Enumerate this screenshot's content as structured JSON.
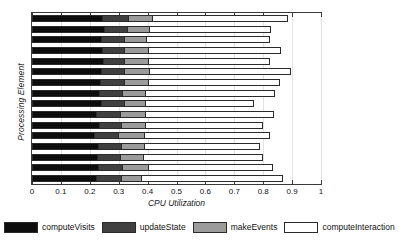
{
  "chart_data": {
    "type": "bar",
    "orientation": "horizontal",
    "stacked": true,
    "title": "",
    "xlabel": "CPU Utilization",
    "ylabel": "Processing Element",
    "xlim": [
      0,
      1
    ],
    "ylim_categories": 16,
    "grid": true,
    "legend_position": "bottom",
    "xticks": [
      "0",
      "0.1",
      "0.2",
      "0.3",
      "0.4",
      "0.5",
      "0.6",
      "0.7",
      "0.8",
      "0.9",
      "1"
    ],
    "xtick_values": [
      0,
      0.1,
      0.2,
      0.3,
      0.4,
      0.5,
      0.6,
      0.7,
      0.8,
      0.9,
      1.0
    ],
    "ytick_labels": [],
    "categories": [
      "PE1",
      "PE2",
      "PE3",
      "PE4",
      "PE5",
      "PE6",
      "PE7",
      "PE8",
      "PE9",
      "PE10",
      "PE11",
      "PE12",
      "PE13",
      "PE14",
      "PE15",
      "PE16"
    ],
    "series": [
      {
        "name": "computeVisits",
        "color": "#0d0d0d",
        "values": [
          0.243,
          0.25,
          0.24,
          0.241,
          0.246,
          0.24,
          0.237,
          0.232,
          0.238,
          0.222,
          0.231,
          0.214,
          0.228,
          0.225,
          0.229,
          0.222
        ]
      },
      {
        "name": "updateState",
        "color": "#404040",
        "values": [
          0.088,
          0.078,
          0.077,
          0.079,
          0.074,
          0.079,
          0.081,
          0.08,
          0.079,
          0.083,
          0.078,
          0.083,
          0.081,
          0.08,
          0.082,
          0.085
        ]
      },
      {
        "name": "makeEvents",
        "color": "#9b9b9b",
        "values": [
          0.085,
          0.078,
          0.076,
          0.082,
          0.083,
          0.087,
          0.084,
          0.079,
          0.073,
          0.085,
          0.081,
          0.091,
          0.08,
          0.078,
          0.089,
          0.069
        ]
      },
      {
        "name": "computeInteraction",
        "color": "#ffffff",
        "values": [
          0.469,
          0.421,
          0.432,
          0.458,
          0.422,
          0.489,
          0.457,
          0.449,
          0.379,
          0.446,
          0.41,
          0.436,
          0.4,
          0.417,
          0.434,
          0.492
        ]
      }
    ],
    "totals": [
      0.885,
      0.827,
      0.825,
      0.86,
      0.825,
      0.895,
      0.859,
      0.84,
      0.769,
      0.836,
      0.8,
      0.824,
      0.789,
      0.8,
      0.834,
      0.868
    ]
  },
  "legend": {
    "items": [
      {
        "label": "computeVisits",
        "color": "#0d0d0d"
      },
      {
        "label": "updateState",
        "color": "#404040"
      },
      {
        "label": "makeEvents",
        "color": "#9b9b9b"
      },
      {
        "label": "computeInteraction",
        "color": "#ffffff"
      }
    ]
  }
}
